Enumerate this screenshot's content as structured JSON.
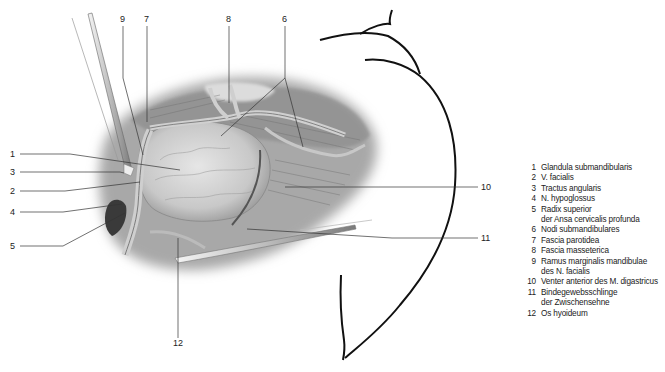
{
  "figure": {
    "callouts": [
      {
        "number": "1",
        "x": 14,
        "y": 157
      },
      {
        "number": "2",
        "x": 14,
        "y": 193
      },
      {
        "number": "3",
        "x": 14,
        "y": 175
      },
      {
        "number": "4",
        "x": 14,
        "y": 214
      },
      {
        "number": "5",
        "x": 14,
        "y": 247
      },
      {
        "number": "6",
        "x": 285,
        "y": 20
      },
      {
        "number": "7",
        "x": 147,
        "y": 20
      },
      {
        "number": "8",
        "x": 229,
        "y": 20
      },
      {
        "number": "9",
        "x": 123,
        "y": 20
      },
      {
        "number": "10",
        "x": 480,
        "y": 189
      },
      {
        "number": "11",
        "x": 480,
        "y": 240
      },
      {
        "number": "12",
        "x": 178,
        "y": 345
      }
    ]
  },
  "legend": {
    "items": [
      {
        "number": "1",
        "lines": [
          "Glandula submandibularis"
        ]
      },
      {
        "number": "2",
        "lines": [
          "V. facialis"
        ]
      },
      {
        "number": "3",
        "lines": [
          "Tractus angularis"
        ]
      },
      {
        "number": "4",
        "lines": [
          "N. hypoglossus"
        ]
      },
      {
        "number": "5",
        "lines": [
          "Radix superior",
          "der Ansa cervicalis profunda"
        ]
      },
      {
        "number": "6",
        "lines": [
          "Nodi submandibulares"
        ]
      },
      {
        "number": "7",
        "lines": [
          "Fascia parotidea"
        ]
      },
      {
        "number": "8",
        "lines": [
          "Fascia masseterica"
        ]
      },
      {
        "number": "9",
        "lines": [
          "Ramus marginalis mandibulae",
          "des N. facialis"
        ]
      },
      {
        "number": "10",
        "lines": [
          "Venter anterior des M. digastricus"
        ]
      },
      {
        "number": "11",
        "lines": [
          "Bindegewebsschlinge",
          "der Zwischensehne"
        ]
      },
      {
        "number": "12",
        "lines": [
          "Os hyoideum"
        ]
      }
    ]
  }
}
